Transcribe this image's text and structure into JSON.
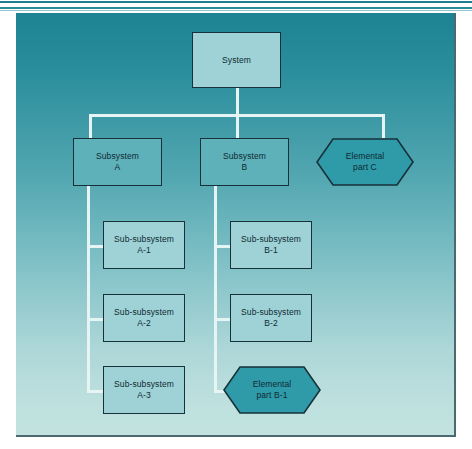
{
  "figure": {
    "kind": "hierarchy-tree-diagram",
    "panel": {
      "background_top_color": "#1d8292",
      "background_bottom_color": "#c3e3e0",
      "border_color": "#4a6a70"
    },
    "connector_color": "#e6f4f3",
    "node_border_color": "#17313a",
    "text_color": "#0e2a33"
  },
  "nodes": {
    "system": {
      "label": "System",
      "shape": "rectangle",
      "fill": "#9fd2d6"
    },
    "subsystem_a": {
      "label": "Subsystem\nA",
      "shape": "rectangle",
      "fill": "#5eb0b9"
    },
    "subsystem_b": {
      "label": "Subsystem\nB",
      "shape": "rectangle",
      "fill": "#5eb0b9"
    },
    "elemental_c": {
      "label": "Elemental\npart C",
      "shape": "hexagon",
      "fill": "#2f9aa8"
    },
    "sub_a1": {
      "label": "Sub-subsystem\nA-1",
      "shape": "rectangle",
      "fill": "#9fd2d6"
    },
    "sub_a2": {
      "label": "Sub-subsystem\nA-2",
      "shape": "rectangle",
      "fill": "#9fd2d6"
    },
    "sub_a3": {
      "label": "Sub-subsystem\nA-3",
      "shape": "rectangle",
      "fill": "#9fd2d6"
    },
    "sub_b1": {
      "label": "Sub-subsystem\nB-1",
      "shape": "rectangle",
      "fill": "#9fd2d6"
    },
    "sub_b2": {
      "label": "Sub-subsystem\nB-2",
      "shape": "rectangle",
      "fill": "#9fd2d6"
    },
    "elemental_b1": {
      "label": "Elemental\npart B-1",
      "shape": "hexagon",
      "fill": "#2f9aa8"
    }
  },
  "edges": [
    {
      "from": "system",
      "to": "subsystem_a"
    },
    {
      "from": "system",
      "to": "subsystem_b"
    },
    {
      "from": "system",
      "to": "elemental_c"
    },
    {
      "from": "subsystem_a",
      "to": "sub_a1"
    },
    {
      "from": "subsystem_a",
      "to": "sub_a2"
    },
    {
      "from": "subsystem_a",
      "to": "sub_a3"
    },
    {
      "from": "subsystem_b",
      "to": "sub_b1"
    },
    {
      "from": "subsystem_b",
      "to": "sub_b2"
    },
    {
      "from": "subsystem_b",
      "to": "elemental_b1"
    }
  ]
}
